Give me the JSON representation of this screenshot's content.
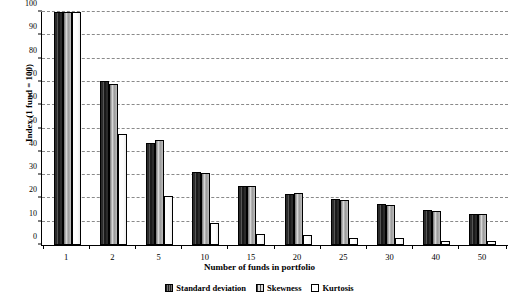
{
  "chart_data": {
    "type": "bar",
    "title": "",
    "xlabel": "Number of funds in portfolio",
    "ylabel": "Index (1 fund = 100)",
    "categories": [
      "1",
      "2",
      "5",
      "10",
      "15",
      "20",
      "25",
      "30",
      "40",
      "50"
    ],
    "series": [
      {
        "name": "Standard deviation",
        "values": [
          100,
          70.3,
          43.8,
          31.4,
          25.5,
          22.0,
          19.6,
          17.5,
          15.0,
          13.4
        ]
      },
      {
        "name": "Skewness",
        "values": [
          100,
          68.9,
          45.0,
          30.9,
          25.2,
          22.2,
          19.2,
          17.0,
          14.8,
          13.3
        ]
      },
      {
        "name": "Kurtosis",
        "values": [
          100,
          47.6,
          20.9,
          9.5,
          4.8,
          4.5,
          3.2,
          3.0,
          1.8,
          1.6
        ]
      }
    ],
    "ylim": [
      0,
      100
    ],
    "yticks": [
      0,
      10,
      20,
      30,
      40,
      50,
      60,
      70,
      80,
      90,
      100
    ],
    "ytick_labels": [
      "0",
      "10",
      "20",
      "30",
      "40",
      "50",
      "60",
      "70",
      "80",
      "90",
      "100"
    ],
    "grid": true,
    "grid_axis": "y",
    "grid_style": "dashed",
    "legend_position": "bottom-center",
    "colors": {
      "standard_deviation": "#2b2b2b",
      "skewness": "#a8a8a8",
      "kurtosis": "#ffffff",
      "axis": "#000000",
      "gridline": "#8a8a8a",
      "background": "#ffffff"
    }
  }
}
